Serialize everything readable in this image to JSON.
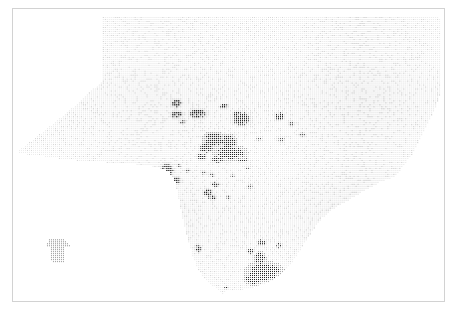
{
  "figure": {
    "title": "",
    "subtitle": "",
    "frame": {
      "x": 12,
      "y": 8,
      "width": 433,
      "height": 294,
      "border_color": "#d2d2d2",
      "background_color": "#ffffff"
    }
  },
  "chart_data": {
    "type": "heatmap",
    "title": "",
    "subtitle": "",
    "xlabel": "",
    "ylabel": "",
    "xlim": [
      0,
      433
    ],
    "ylim": [
      0,
      294
    ],
    "grid": false,
    "legend_position": "none",
    "tick_labels": {
      "x": [],
      "y": []
    },
    "annotations": [],
    "marker": {
      "shape": "square",
      "size_px": 1.25,
      "grid_pitch_px": 2
    },
    "colors": {
      "background": "#ffffff",
      "low_density_dot": "#e9e9e9",
      "mid_density_dot": "#bdbdbd",
      "high_density_dot": "#6e6e6e",
      "peak_density_dot": "#2e2e2e",
      "frame": "#d2d2d2"
    },
    "density_scale": {
      "levels": [
        "very low",
        "low",
        "medium",
        "high",
        "very high"
      ],
      "level_colors": [
        "#ededed",
        "#d8d8d8",
        "#a8a8a8",
        "#5f5f5f",
        "#262626"
      ]
    },
    "study_area_polygon": [
      [
        268,
        20
      ],
      [
        700,
        20
      ],
      [
        1050,
        22
      ],
      [
        1285,
        24
      ],
      [
        1288,
        120
      ],
      [
        1286,
        250
      ],
      [
        1270,
        300
      ],
      [
        1240,
        360
      ],
      [
        1205,
        430
      ],
      [
        1175,
        470
      ],
      [
        1150,
        505
      ],
      [
        1105,
        520
      ],
      [
        1060,
        545
      ],
      [
        1010,
        575
      ],
      [
        965,
        600
      ],
      [
        930,
        628
      ],
      [
        905,
        660
      ],
      [
        880,
        700
      ],
      [
        858,
        735
      ],
      [
        835,
        770
      ],
      [
        805,
        800
      ],
      [
        770,
        822
      ],
      [
        730,
        838
      ],
      [
        690,
        846
      ],
      [
        655,
        850
      ],
      [
        640,
        846
      ],
      [
        632,
        862
      ],
      [
        620,
        848
      ],
      [
        600,
        836
      ],
      [
        575,
        812
      ],
      [
        555,
        782
      ],
      [
        540,
        745
      ],
      [
        528,
        705
      ],
      [
        516,
        660
      ],
      [
        505,
        612
      ],
      [
        496,
        565
      ],
      [
        486,
        520
      ],
      [
        470,
        492
      ],
      [
        440,
        478
      ],
      [
        400,
        470
      ],
      [
        345,
        466
      ],
      [
        285,
        462
      ],
      [
        215,
        458
      ],
      [
        150,
        452
      ],
      [
        95,
        444
      ],
      [
        40,
        438
      ],
      [
        14,
        432
      ],
      [
        16,
        424
      ],
      [
        60,
        392
      ],
      [
        110,
        352
      ],
      [
        160,
        312
      ],
      [
        205,
        272
      ],
      [
        248,
        232
      ],
      [
        268,
        212
      ],
      [
        268,
        150
      ],
      [
        268,
        80
      ]
    ],
    "inset_polygon": [
      [
        108,
        690
      ],
      [
        150,
        690
      ],
      [
        156,
        700
      ],
      [
        168,
        708
      ],
      [
        168,
        716
      ],
      [
        152,
        720
      ],
      [
        150,
        762
      ],
      [
        114,
        762
      ],
      [
        112,
        720
      ],
      [
        96,
        716
      ],
      [
        96,
        708
      ],
      [
        104,
        700
      ]
    ],
    "high_density_clusters": [
      {
        "id": "cluster-north-1",
        "cx": 490,
        "cy": 282,
        "rx": 14,
        "ry": 12,
        "level": 4
      },
      {
        "id": "cluster-north-2",
        "cx": 492,
        "cy": 318,
        "rx": 16,
        "ry": 11,
        "level": 4
      },
      {
        "id": "cluster-north-3",
        "cx": 508,
        "cy": 338,
        "rx": 10,
        "ry": 7,
        "level": 3
      },
      {
        "id": "cluster-north-4",
        "cx": 556,
        "cy": 314,
        "rx": 24,
        "ry": 14,
        "level": 4
      },
      {
        "id": "cluster-north-5",
        "cx": 634,
        "cy": 292,
        "rx": 12,
        "ry": 7,
        "level": 4
      },
      {
        "id": "cluster-north-6",
        "cx": 686,
        "cy": 330,
        "rx": 26,
        "ry": 20,
        "level": 4
      },
      {
        "id": "cluster-north-7",
        "cx": 672,
        "cy": 318,
        "rx": 12,
        "ry": 10,
        "level": 4
      },
      {
        "id": "cluster-ne-1",
        "cx": 800,
        "cy": 322,
        "rx": 14,
        "ry": 11,
        "level": 4
      },
      {
        "id": "cluster-ne-2",
        "cx": 836,
        "cy": 344,
        "rx": 9,
        "ry": 8,
        "level": 3
      },
      {
        "id": "cluster-ne-3",
        "cx": 870,
        "cy": 378,
        "rx": 9,
        "ry": 7,
        "level": 3
      },
      {
        "id": "cluster-ne-4",
        "cx": 806,
        "cy": 392,
        "rx": 10,
        "ry": 8,
        "level": 3
      },
      {
        "id": "cluster-ne-5",
        "cx": 738,
        "cy": 390,
        "rx": 7,
        "ry": 6,
        "level": 3
      },
      {
        "id": "cluster-core-1",
        "cx": 604,
        "cy": 392,
        "rx": 28,
        "ry": 18,
        "level": 5
      },
      {
        "id": "cluster-core-2",
        "cx": 646,
        "cy": 400,
        "rx": 22,
        "ry": 20,
        "level": 5
      },
      {
        "id": "cluster-core-3",
        "cx": 652,
        "cy": 432,
        "rx": 40,
        "ry": 18,
        "level": 5
      },
      {
        "id": "cluster-core-4",
        "cx": 580,
        "cy": 418,
        "rx": 20,
        "ry": 14,
        "level": 4
      },
      {
        "id": "cluster-core-5",
        "cx": 566,
        "cy": 444,
        "rx": 14,
        "ry": 10,
        "level": 4
      },
      {
        "id": "cluster-core-6",
        "cx": 614,
        "cy": 452,
        "rx": 18,
        "ry": 10,
        "level": 4
      },
      {
        "id": "cluster-core-7",
        "cx": 690,
        "cy": 452,
        "rx": 14,
        "ry": 9,
        "level": 4
      },
      {
        "id": "cluster-west-1",
        "cx": 462,
        "cy": 486,
        "rx": 18,
        "ry": 20,
        "level": 4
      },
      {
        "id": "cluster-west-2",
        "cx": 488,
        "cy": 516,
        "rx": 12,
        "ry": 12,
        "level": 4
      },
      {
        "id": "cluster-west-3",
        "cx": 500,
        "cy": 470,
        "rx": 7,
        "ry": 6,
        "level": 3
      },
      {
        "id": "cluster-west-4",
        "cx": 524,
        "cy": 486,
        "rx": 7,
        "ry": 6,
        "level": 3
      },
      {
        "id": "cluster-mid-1",
        "cx": 572,
        "cy": 492,
        "rx": 7,
        "ry": 6,
        "level": 3
      },
      {
        "id": "cluster-mid-2",
        "cx": 596,
        "cy": 500,
        "rx": 8,
        "ry": 6,
        "level": 3
      },
      {
        "id": "cluster-mid-3",
        "cx": 608,
        "cy": 528,
        "rx": 12,
        "ry": 7,
        "level": 4
      },
      {
        "id": "cluster-mid-4",
        "cx": 584,
        "cy": 552,
        "rx": 14,
        "ry": 10,
        "level": 4
      },
      {
        "id": "cluster-mid-5",
        "cx": 598,
        "cy": 566,
        "rx": 12,
        "ry": 8,
        "level": 4
      },
      {
        "id": "cluster-mid-6",
        "cx": 646,
        "cy": 566,
        "rx": 7,
        "ry": 5,
        "level": 3
      },
      {
        "id": "cluster-mid-7",
        "cx": 660,
        "cy": 502,
        "rx": 7,
        "ry": 5,
        "level": 3
      },
      {
        "id": "cluster-mid-8",
        "cx": 712,
        "cy": 534,
        "rx": 8,
        "ry": 7,
        "level": 3
      },
      {
        "id": "cluster-mid-9",
        "cx": 704,
        "cy": 476,
        "rx": 8,
        "ry": 6,
        "level": 3
      },
      {
        "id": "cluster-south-1",
        "cx": 748,
        "cy": 704,
        "rx": 12,
        "ry": 10,
        "level": 4
      },
      {
        "id": "cluster-south-2",
        "cx": 800,
        "cy": 712,
        "rx": 9,
        "ry": 8,
        "level": 4
      },
      {
        "id": "cluster-south-3",
        "cx": 714,
        "cy": 730,
        "rx": 10,
        "ry": 8,
        "level": 4
      },
      {
        "id": "cluster-south-4",
        "cx": 742,
        "cy": 752,
        "rx": 14,
        "ry": 16,
        "level": 5
      },
      {
        "id": "cluster-south-5",
        "cx": 756,
        "cy": 792,
        "rx": 44,
        "ry": 24,
        "level": 5
      },
      {
        "id": "cluster-south-6",
        "cx": 722,
        "cy": 812,
        "rx": 22,
        "ry": 16,
        "level": 5
      },
      {
        "id": "cluster-south-7",
        "cx": 556,
        "cy": 722,
        "rx": 9,
        "ry": 11,
        "level": 4
      },
      {
        "id": "cluster-south-8",
        "cx": 640,
        "cy": 840,
        "rx": 5,
        "ry": 5,
        "level": 4
      }
    ]
  }
}
